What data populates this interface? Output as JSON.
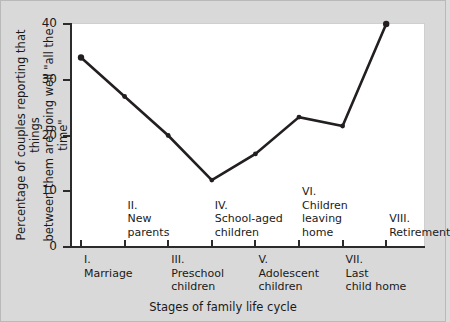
{
  "chart_data": {
    "type": "line",
    "title": "",
    "xlabel": "Stages of family life cycle",
    "ylabel": "Percentage of couples reporting that things between them are going well \"all the time\"",
    "ylim": [
      0,
      40
    ],
    "yticks": [
      0,
      10,
      20,
      30,
      40
    ],
    "ytick_labels": [
      "0",
      "10",
      "20",
      "30",
      "40"
    ],
    "grid": false,
    "legend": "none",
    "categories": [
      "I. Marriage",
      "II. New parents",
      "III. Preschool children",
      "IV. School-aged children",
      "V. Adolescent children",
      "VI. Children leaving home",
      "VII. Last child home",
      "VIII. Retirement"
    ],
    "values": [
      34,
      27,
      20,
      12,
      16.7,
      23.3,
      21.7,
      40
    ],
    "marker": "circle",
    "line_color": "#231f20"
  },
  "axis": {
    "y_title": "Percentage of couples reporting that things\nbetween them are going well \"all the time\"",
    "y_title_line1": "Percentage of couples reporting that things",
    "y_title_line2": "between them are going well \"all the time\"",
    "x_title": "Stages of family life cycle",
    "y_ticks": [
      {
        "value": 40,
        "label": "40"
      },
      {
        "value": 30,
        "label": "30"
      },
      {
        "value": 20,
        "label": "20"
      },
      {
        "value": 10,
        "label": "10"
      },
      {
        "value": 0,
        "label": "0"
      }
    ]
  },
  "stages": [
    {
      "numeral": "I.",
      "name": "Marriage",
      "row": "lower",
      "lines": "I.\nMarriage"
    },
    {
      "numeral": "II.",
      "name": "New parents",
      "row": "upper",
      "lines": "II.\nNew\nparents"
    },
    {
      "numeral": "III.",
      "name": "Preschool children",
      "row": "lower",
      "lines": "III.\nPreschool\nchildren"
    },
    {
      "numeral": "IV.",
      "name": "School-aged children",
      "row": "upper",
      "lines": "IV.\nSchool-aged\nchildren"
    },
    {
      "numeral": "V.",
      "name": "Adolescent children",
      "row": "lower",
      "lines": "V.\nAdolescent\nchildren"
    },
    {
      "numeral": "VI.",
      "name": "Children leaving home",
      "row": "upper",
      "lines": "VI.\nChildren\nleaving\nhome"
    },
    {
      "numeral": "VII.",
      "name": "Last child home",
      "row": "lower",
      "lines": "VII.\nLast\nchild home"
    },
    {
      "numeral": "VIII.",
      "name": "Retirement",
      "row": "upper",
      "lines": "VIII.\nRetirement"
    }
  ],
  "colors": {
    "background": "#d9d9d9",
    "plot_background": "#ffffff",
    "line": "#231f20",
    "axis": "#2b2b2b",
    "text": "#1a1a1a"
  }
}
